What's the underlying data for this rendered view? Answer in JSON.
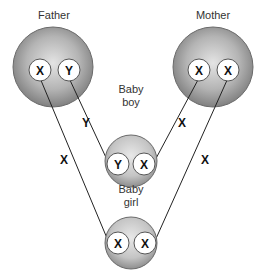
{
  "diagram": {
    "type": "x-linked-inheritance",
    "nodes": {
      "father": {
        "label": "Father",
        "chromosomes": [
          "X",
          "Y"
        ]
      },
      "mother": {
        "label": "Mother",
        "chromosomes": [
          "X",
          "X"
        ]
      },
      "baby_boy": {
        "label_line1": "Baby",
        "label_line2": "boy",
        "chromosomes": [
          "Y",
          "X"
        ]
      },
      "baby_girl": {
        "label_line1": "Baby",
        "label_line2": "girl",
        "chromosomes": [
          "X",
          "X"
        ]
      }
    },
    "edges": [
      {
        "from": "father.Y",
        "to": "baby_boy.Y",
        "label": "Y"
      },
      {
        "from": "mother.X1",
        "to": "baby_boy.X",
        "label": "X"
      },
      {
        "from": "father.X",
        "to": "baby_girl.X1",
        "label": "X"
      },
      {
        "from": "mother.X2",
        "to": "baby_girl.X2",
        "label": "X"
      }
    ],
    "colors": {
      "cell_center": "#d8d8d8",
      "cell_edge": "#7a7a7a",
      "chromosome_fill": "#ffffff",
      "line": "#222222"
    }
  }
}
